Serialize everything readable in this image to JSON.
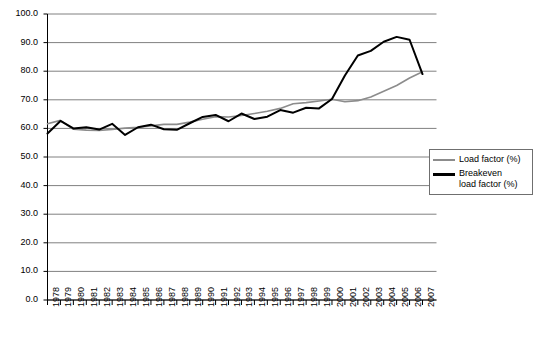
{
  "chart_data": {
    "type": "line",
    "title": "",
    "xlabel": "",
    "ylabel": "",
    "ylim": [
      0.0,
      100.0
    ],
    "ytick_step": 10.0,
    "grid": true,
    "legend_position": "right",
    "categories": [
      "1978",
      "1979",
      "1980",
      "1981",
      "1982",
      "1983",
      "1984",
      "1985",
      "1986",
      "1987",
      "1988",
      "1989",
      "1990",
      "1991",
      "1992",
      "1993",
      "1994",
      "1995",
      "1996",
      "1997",
      "1998",
      "1999",
      "2000",
      "2001",
      "2002",
      "2003",
      "2004",
      "2005",
      "2006",
      "2007"
    ],
    "yticks": [
      "0.0",
      "10.0",
      "20.0",
      "30.0",
      "40.0",
      "50.0",
      "60.0",
      "70.0",
      "80.0",
      "90.0",
      "100.0"
    ],
    "series": [
      {
        "name": "Load factor (%)",
        "color": "#8c8c8c",
        "values": [
          61.6,
          62.8,
          59.7,
          59.4,
          59.3,
          59.6,
          60.1,
          60.4,
          60.9,
          61.4,
          61.4,
          62.2,
          63.2,
          64.1,
          64.0,
          64.5,
          65.2,
          66.0,
          67.0,
          68.6,
          69.0,
          69.6,
          70.2,
          69.3,
          69.7,
          71.0,
          73.0,
          75.0,
          77.6,
          79.8
        ]
      },
      {
        "name": "Breakeven load factor (%)",
        "color": "#000000",
        "values": [
          58.2,
          62.6,
          60.0,
          60.4,
          59.6,
          61.6,
          57.7,
          60.4,
          61.3,
          59.7,
          59.5,
          61.8,
          64.0,
          64.7,
          62.5,
          65.2,
          63.3,
          64.1,
          66.4,
          65.5,
          67.2,
          67.0,
          70.3,
          78.5,
          85.5,
          87.1,
          90.3,
          92.0,
          91.0,
          79.0
        ]
      }
    ]
  },
  "legend": {
    "items": [
      {
        "label": "Load factor (%)",
        "swatch": "load"
      },
      {
        "label": "Breakeven load factor (%)",
        "swatch": "breakeven"
      }
    ],
    "load_label": "Load factor (%)",
    "breakeven_label_line1": "Breakeven",
    "breakeven_label_line2": "load factor (%)"
  },
  "colors": {
    "load_factor": "#8c8c8c",
    "breakeven": "#000000",
    "grid": "#808080",
    "axis": "#000000",
    "background": "#ffffff"
  }
}
